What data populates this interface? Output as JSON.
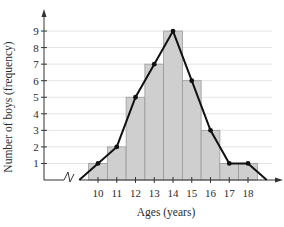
{
  "chart_data": {
    "type": "bar",
    "subtype": "histogram-with-frequency-polygon",
    "title": "",
    "xlabel": "Ages (years)",
    "ylabel": "Number of boys (frequency)",
    "categories": [
      "10",
      "11",
      "12",
      "13",
      "14",
      "15",
      "16",
      "17",
      "18"
    ],
    "values": [
      1,
      2,
      5,
      7,
      9,
      6,
      3,
      1,
      1
    ],
    "series": [
      {
        "name": "Histogram",
        "type": "bar",
        "values": [
          1,
          2,
          5,
          7,
          9,
          6,
          3,
          1,
          1
        ]
      },
      {
        "name": "Frequency polygon",
        "type": "line",
        "x": [
          9,
          10,
          11,
          12,
          13,
          14,
          15,
          16,
          17,
          18,
          19
        ],
        "values": [
          0,
          1,
          2,
          5,
          7,
          9,
          6,
          3,
          1,
          1,
          0
        ]
      }
    ],
    "yticks": [
      "1",
      "2",
      "3",
      "4",
      "5",
      "6",
      "7",
      "8",
      "9"
    ],
    "xticks": [
      "10",
      "11",
      "12",
      "13",
      "14",
      "15",
      "16",
      "17",
      "18"
    ],
    "ylim": [
      0,
      9
    ],
    "grid": true,
    "axis_break": "x-axis",
    "legend": "none"
  },
  "colors": {
    "bar_fill": "#cfcfcf",
    "bar_stroke": "#9a9a9a",
    "line": "#111111",
    "grid": "#e4e4e4",
    "axis": "#333333"
  }
}
